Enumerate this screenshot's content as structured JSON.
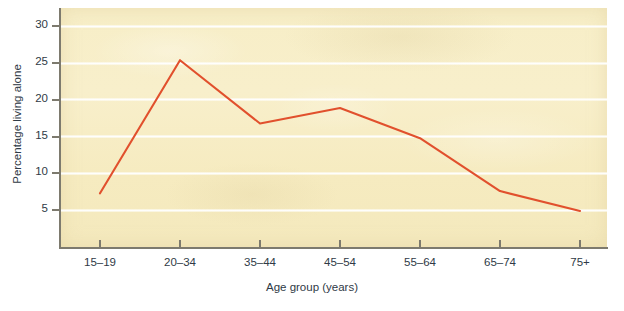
{
  "chart_data": {
    "type": "line",
    "title": "",
    "xlabel": "Age group (years)",
    "ylabel": "Percentage living alone",
    "categories": [
      "15–19",
      "20–34",
      "35–44",
      "45–54",
      "55–64",
      "65–74",
      "75+"
    ],
    "series": [
      {
        "name": "Percentage living alone",
        "color": "#e1502d",
        "values": [
          7.3,
          25.4,
          16.8,
          18.9,
          14.8,
          7.6,
          4.9
        ]
      }
    ],
    "yticks": [
      5,
      10,
      15,
      20,
      25,
      30
    ],
    "ytick_labels": [
      "5",
      "10",
      "15",
      "20",
      "25",
      "30"
    ],
    "ylim": [
      0,
      32.5
    ],
    "grid": "horizontal",
    "legend": "none",
    "plot_background": "#f7eec7",
    "axis_color": "#7d7a6e",
    "text_color": "#2f3a46"
  }
}
